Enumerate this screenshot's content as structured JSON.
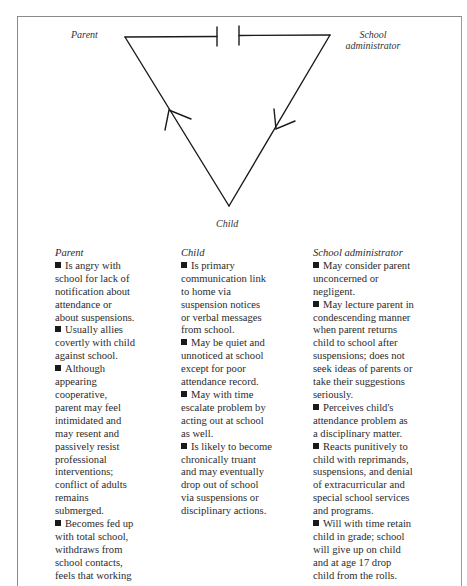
{
  "diagram": {
    "type": "triangle",
    "nodes": {
      "parent": "Parent",
      "school_admin_line1": "School",
      "school_admin_line2": "administrator",
      "child": "Child"
    },
    "edges": [
      {
        "from": "Parent",
        "to": "School administrator",
        "style": "broken (gap with blocking ticks)"
      },
      {
        "from": "Child",
        "to": "Parent",
        "style": "arrow toward Parent"
      },
      {
        "from": "School administrator",
        "to": "Child",
        "style": "arrow toward Child"
      }
    ],
    "line_color": "#1a1a1a"
  },
  "columns": {
    "parent": {
      "heading": "Parent",
      "lines": [
        "Is angry with",
        "school for lack of",
        "notification about",
        "attendance or",
        "about suspensions.",
        "Usually allies",
        "covertly with child",
        "against school.",
        "Although",
        "appearing",
        "cooperative,",
        "parent may feel",
        "intimidated and",
        "may resent and",
        "passively resist",
        "professional",
        "interventions;",
        "conflict of adults",
        "remains",
        "submerged.",
        "Becomes fed up",
        "with total school,",
        "withdraws from",
        "school contacts,",
        "feels that working"
      ]
    },
    "child": {
      "heading": "Child",
      "lines": [
        "Is primary",
        "communication link",
        "to home via",
        "suspension notices",
        "or verbal messages",
        "from school.",
        "May be quiet and",
        "unnoticed at school",
        "except for poor",
        "attendance record.",
        "May with time",
        "escalate problem by",
        "acting out at school",
        "as well.",
        "Is likely to become",
        "chronically truant",
        "and may eventually",
        "drop out of school",
        "via suspensions or",
        "disciplinary actions."
      ]
    },
    "school_admin": {
      "heading": "School administrator",
      "lines": [
        "May consider parent",
        "unconcerned or",
        "negligent.",
        "May lecture parent in",
        "condescending manner",
        "when parent returns",
        "child to school after",
        "suspensions; does not",
        "seek ideas of parents or",
        "take their suggestions",
        "seriously.",
        "Perceives child's",
        "attendance problem as",
        "a disciplinary matter.",
        "Reacts punitively to",
        "child with reprimands,",
        "suspensions, and denial",
        "of extracurricular and",
        "special school services",
        "and programs.",
        "Will with time retain",
        "child in grade; school",
        "will give up on child",
        "and at age 17 drop",
        "child from the rolls."
      ]
    }
  }
}
